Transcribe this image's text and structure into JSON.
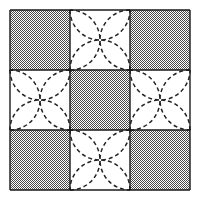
{
  "figure": {
    "canvas": {
      "width": 199,
      "height": 198,
      "background": "#ffffff"
    },
    "grid": {
      "x": 10,
      "y": 10,
      "cell_size": 60,
      "rows": 3,
      "cols": 3,
      "line_color": "#1a1a1a",
      "line_width": 1.4
    },
    "colors": {
      "shaded": "#9a9a9a",
      "plain": "#ffffff",
      "outline": "#1a1a1a",
      "arc": "#222222"
    },
    "arc": {
      "style": "dashed",
      "dash_pattern": "4 3",
      "stroke_width": 1.5,
      "radius_fraction": 0.5,
      "description": "quarter-circle arcs bulging inward from each cell edge midpoint"
    },
    "cells": [
      {
        "row": 0,
        "col": 0,
        "fill": "shaded",
        "motif": "none"
      },
      {
        "row": 0,
        "col": 1,
        "fill": "plain",
        "motif": "four-petal"
      },
      {
        "row": 0,
        "col": 2,
        "fill": "shaded",
        "motif": "none"
      },
      {
        "row": 1,
        "col": 0,
        "fill": "plain",
        "motif": "four-petal"
      },
      {
        "row": 1,
        "col": 1,
        "fill": "shaded",
        "motif": "none"
      },
      {
        "row": 1,
        "col": 2,
        "fill": "plain",
        "motif": "four-petal"
      },
      {
        "row": 2,
        "col": 0,
        "fill": "shaded",
        "motif": "none"
      },
      {
        "row": 2,
        "col": 1,
        "fill": "plain",
        "motif": "four-petal"
      },
      {
        "row": 2,
        "col": 2,
        "fill": "shaded",
        "motif": "none"
      }
    ]
  }
}
